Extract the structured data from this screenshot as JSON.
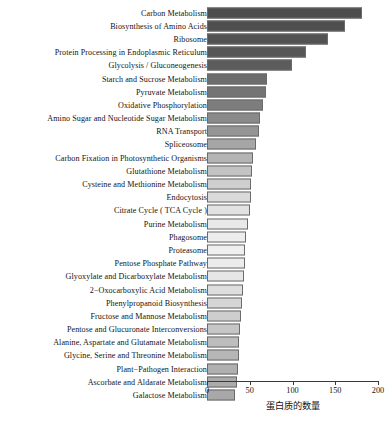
{
  "chart_data": {
    "type": "bar",
    "orientation": "horizontal",
    "title": "",
    "xlabel": "蛋白质的数量",
    "ylabel": "",
    "xlim": [
      0,
      200
    ],
    "xticks": [
      0,
      50,
      100,
      150,
      200
    ],
    "xtick_labels": [
      "0",
      "50",
      "100",
      "150",
      "200"
    ],
    "grid": false,
    "legend": "none",
    "categories": [
      "Carbon Metabolism",
      "Biosynthesis of Amino Acids",
      "Ribosome",
      "Protein Processing in Endoplasmic Reticulum",
      "Glycolysis / Gluconeogenesis",
      "Starch and Sucrose Metabolism",
      "Pyruvate Metabolism",
      "Oxidative Phosphorylation",
      "Amino Sugar and Nucleotide Sugar Metabolism",
      "RNA Transport",
      "Spliceosome",
      "Carbon Fixation in Photosynthetic Organisms",
      "Glutathione Metabolism",
      "Cysteine and Methionine Metabolism",
      "Endocytosis",
      "Citrate Cycle ( TCA Cycle )",
      "Purine Metabolism",
      "Phagosome",
      "Proteasome",
      "Pentose Phosphate Pathway",
      "Glyoxylate and Dicarboxylate Metabolism",
      "2−Oxocarboxylic Acid Metabolism",
      "Phenylpropanoid Biosynthesis",
      "Fructose and Mannose Metabolism",
      "Pentose and Glucuronate Interconversions",
      "Alanine, Aspartate and Glutamate Metabolism",
      "Glycine, Serine and Threonine Metabolism",
      "Plant−Pathogen Interaction",
      "Ascorbate and Aldarate Metabolism",
      "Galactose Metabolism"
    ],
    "values": [
      181,
      161,
      142,
      116,
      99,
      70,
      69,
      65,
      62,
      61,
      57,
      54,
      53,
      52,
      51,
      50,
      48,
      46,
      45,
      44,
      43,
      42,
      41,
      40,
      39,
      38,
      37,
      36,
      35,
      33
    ],
    "bar_colors": [
      "#4d4d4d",
      "#4f4f4f",
      "#525252",
      "#565656",
      "#5c5c5c",
      "#6d6d6d",
      "#747474",
      "#7d7d7d",
      "#8a8a8a",
      "#959595",
      "#a6a6a6",
      "#b4b4b4",
      "#c3c3c3",
      "#cfcfcf",
      "#dadada",
      "#e2e2e2",
      "#e9e9e9",
      "#ededed",
      "#efefef",
      "#ececec",
      "#e6e6e6",
      "#dedede",
      "#d6d6d6",
      "#cecece",
      "#c6c6c6",
      "#bdbdbd",
      "#b6b6b6",
      "#b0b0b0",
      "#ababab",
      "#a8a8a8"
    ],
    "bar_edge_color": "#6b6b6b",
    "axis_color": "#3a3a3a",
    "background": "#ffffff"
  }
}
